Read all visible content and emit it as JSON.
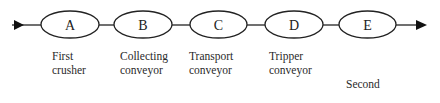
{
  "diagram": {
    "type": "process-flow",
    "colors": {
      "stroke": "#222222",
      "background": "#ffffff",
      "text": "#2a2a2a"
    },
    "nodes": [
      {
        "id": "A",
        "label": "A",
        "description_lines": [
          "First",
          "crusher"
        ]
      },
      {
        "id": "B",
        "label": "B",
        "description_lines": [
          "Collecting",
          "conveyor"
        ]
      },
      {
        "id": "C",
        "label": "C",
        "description_lines": [
          "Transport",
          "conveyor"
        ]
      },
      {
        "id": "D",
        "label": "D",
        "description_lines": [
          "Tripper",
          "conveyor"
        ]
      },
      {
        "id": "E",
        "label": "E",
        "description_lines": [
          "Second",
          "crusher  +",
          "vibrating",
          "screen"
        ]
      }
    ],
    "edges": [
      {
        "from": "input",
        "to": "A",
        "arrow": true
      },
      {
        "from": "A",
        "to": "B",
        "arrow": false
      },
      {
        "from": "B",
        "to": "C",
        "arrow": false
      },
      {
        "from": "C",
        "to": "D",
        "arrow": false
      },
      {
        "from": "D",
        "to": "E",
        "arrow": false
      },
      {
        "from": "E",
        "to": "output",
        "arrow": true
      }
    ]
  }
}
